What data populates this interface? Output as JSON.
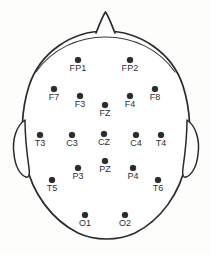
{
  "diagram": {
    "orientation": "superior view, nose at top",
    "background_color": "#fdfdfc",
    "ink_color": "#2b2b2b",
    "head": {
      "outline_name": "head-outline",
      "nose_name": "nose-marker",
      "left_ear_name": "left-ear",
      "right_ear_name": "right-ear"
    },
    "electrode_count": 19,
    "electrodes": [
      {
        "label": "FP1",
        "x": 78,
        "y": 60,
        "label_pos": "below-center"
      },
      {
        "label": "FP2",
        "x": 130,
        "y": 60,
        "label_pos": "below-center"
      },
      {
        "label": "F7",
        "x": 54,
        "y": 89,
        "label_pos": "below-center"
      },
      {
        "label": "F3",
        "x": 80,
        "y": 96,
        "label_pos": "below-center"
      },
      {
        "label": "FZ",
        "x": 105,
        "y": 105,
        "label_pos": "below-center"
      },
      {
        "label": "F4",
        "x": 130,
        "y": 96,
        "label_pos": "below-center"
      },
      {
        "label": "F8",
        "x": 155,
        "y": 89,
        "label_pos": "below-center"
      },
      {
        "label": "T3",
        "x": 40,
        "y": 135,
        "label_pos": "below-center"
      },
      {
        "label": "C3",
        "x": 72,
        "y": 135,
        "label_pos": "below-center"
      },
      {
        "label": "CZ",
        "x": 104,
        "y": 134,
        "label_pos": "below-center"
      },
      {
        "label": "C4",
        "x": 136,
        "y": 135,
        "label_pos": "below-center"
      },
      {
        "label": "T4",
        "x": 161,
        "y": 135,
        "label_pos": "below-center"
      },
      {
        "label": "P3",
        "x": 78,
        "y": 168,
        "label_pos": "below-center"
      },
      {
        "label": "PZ",
        "x": 105,
        "y": 161,
        "label_pos": "below-center"
      },
      {
        "label": "P4",
        "x": 133,
        "y": 168,
        "label_pos": "below-center"
      },
      {
        "label": "T5",
        "x": 52,
        "y": 180,
        "label_pos": "below-center"
      },
      {
        "label": "T6",
        "x": 158,
        "y": 180,
        "label_pos": "below-center"
      },
      {
        "label": "O1",
        "x": 85,
        "y": 215,
        "label_pos": "below-center"
      },
      {
        "label": "O2",
        "x": 125,
        "y": 215,
        "label_pos": "below-center"
      }
    ]
  }
}
